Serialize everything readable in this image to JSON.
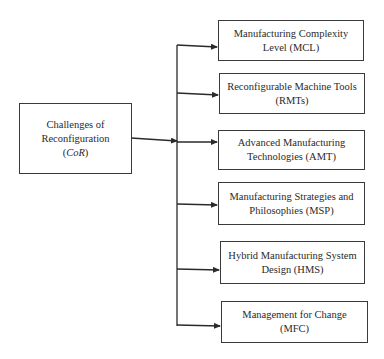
{
  "diagram": {
    "root": {
      "line1": "Challenges of",
      "line2": "Reconfiguration",
      "line3_open": "(",
      "line3_italic": "CoR",
      "line3_close": ")"
    },
    "children": [
      {
        "line1": "Manufacturing Complexity",
        "line2": "Level (MCL)"
      },
      {
        "line1": "Reconfigurable Machine Tools",
        "line2": "(RMTs)"
      },
      {
        "line1": "Advanced Manufacturing",
        "line2": "Technologies (AMT)"
      },
      {
        "line1": "Manufacturing Strategies and",
        "line2": "Philosophies (MSP)"
      },
      {
        "line1": "Hybrid Manufacturing System",
        "line2": "Design (HMS)"
      },
      {
        "line1": "Management for Change",
        "line2": "(MFC)"
      }
    ],
    "colors": {
      "line": "#2a2a2a",
      "background": "#ffffff"
    }
  }
}
